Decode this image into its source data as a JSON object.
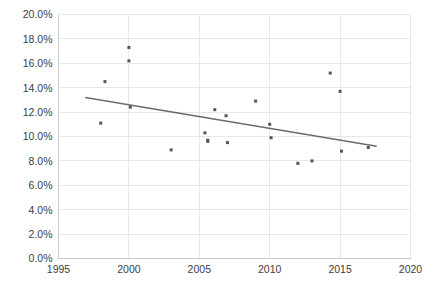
{
  "chart_data": {
    "type": "scatter",
    "title": "",
    "subtitle": "",
    "xlabel": "",
    "ylabel": "",
    "xlim": [
      1995,
      2020
    ],
    "ylim": [
      0.0,
      20.0
    ],
    "grid": true,
    "legend": false,
    "legend_position": "none",
    "y_tick_labels": [
      "0.0%",
      "2.0%",
      "4.0%",
      "6.0%",
      "8.0%",
      "10.0%",
      "12.0%",
      "14.0%",
      "16.0%",
      "18.0%",
      "20.0%"
    ],
    "y_tick_values": [
      0.0,
      2.0,
      4.0,
      6.0,
      8.0,
      10.0,
      12.0,
      14.0,
      16.0,
      18.0,
      20.0
    ],
    "x_tick_labels": [
      "1995",
      "2000",
      "2005",
      "2010",
      "2015",
      "2020"
    ],
    "x_tick_values": [
      1995,
      2000,
      2005,
      2010,
      2015,
      2020
    ],
    "point_color": "#555555",
    "trendline_color": "#6b6b6b",
    "gridline_color": "#e8e8ec",
    "axis_color": "#c9c9cf",
    "series": [
      {
        "name": "observations",
        "marker": "square",
        "x": [
          1998.0,
          1998.3,
          2000.0,
          2000.0,
          2000.1,
          2003.0,
          2005.4,
          2005.6,
          2005.6,
          2006.1,
          2006.9,
          2007.0,
          2009.0,
          2010.0,
          2010.1,
          2012.0,
          2013.0,
          2014.3,
          2015.0,
          2015.1,
          2017.0
        ],
        "y": [
          11.1,
          14.5,
          17.3,
          16.2,
          12.4,
          8.9,
          10.3,
          9.7,
          9.6,
          12.2,
          11.7,
          9.5,
          12.9,
          11.0,
          9.9,
          7.8,
          8.0,
          15.2,
          13.7,
          8.8,
          9.1
        ]
      }
    ],
    "trendline": {
      "type": "linear",
      "x": [
        1996.9,
        2017.6
      ],
      "y": [
        13.2,
        9.2
      ]
    }
  }
}
